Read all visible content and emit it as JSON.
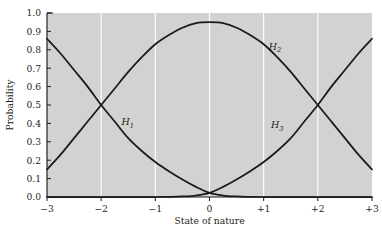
{
  "chart_data": {
    "type": "line",
    "title": "",
    "subtitle": "",
    "xlabel": "State of nature",
    "ylabel": "Probability",
    "xlim": [
      -3,
      3
    ],
    "ylim": [
      0.0,
      1.0
    ],
    "grid": "vertical-white-gridlines-at-major-x-ticks",
    "legend": "inline-curve-labels",
    "xticks": [
      -3,
      -2,
      -1,
      0,
      1,
      2,
      3
    ],
    "xtick_labels": [
      "−3",
      "−2",
      "−1",
      "0",
      "+1",
      "+2",
      "+3"
    ],
    "yticks": [
      0.0,
      0.1,
      0.2,
      0.3,
      0.4,
      0.5,
      0.6,
      0.7,
      0.8,
      0.9,
      1.0
    ],
    "ytick_labels": [
      "0.0",
      "0.1",
      "0.2",
      "0.3",
      "0.4",
      "0.5",
      "0.6",
      "0.7",
      "0.8",
      "0.9",
      "1.0"
    ],
    "x": [
      -3.0,
      -2.75,
      -2.5,
      -2.25,
      -2.0,
      -1.75,
      -1.5,
      -1.25,
      -1.0,
      -0.75,
      -0.5,
      -0.25,
      0.0,
      0.25,
      0.5,
      0.75,
      1.0,
      1.25,
      1.5,
      1.75,
      2.0,
      2.25,
      2.5,
      2.75,
      3.0
    ],
    "series": [
      {
        "name": "H_1",
        "label": "H",
        "subscript": "1",
        "label_x": -1.55,
        "label_y": 0.39,
        "description": "Decreasing sigmoid curve: high probability at left, falls to near zero at right",
        "values": [
          0.86,
          0.78,
          0.69,
          0.6,
          0.5,
          0.41,
          0.32,
          0.25,
          0.19,
          0.14,
          0.095,
          0.055,
          0.022,
          0.008,
          0.003,
          0.001,
          0.0,
          0.0,
          0.0,
          0.0,
          0.0,
          0.0,
          0.0,
          0.0,
          0.0
        ]
      },
      {
        "name": "H_2",
        "label": "H",
        "subscript": "2",
        "label_x": 1.17,
        "label_y": 0.8,
        "description": "Bell-shaped curve peaking at 0.95 at state of nature 0",
        "values": [
          0.15,
          0.23,
          0.32,
          0.41,
          0.5,
          0.59,
          0.68,
          0.76,
          0.83,
          0.88,
          0.92,
          0.945,
          0.95,
          0.945,
          0.92,
          0.88,
          0.83,
          0.76,
          0.68,
          0.59,
          0.5,
          0.41,
          0.32,
          0.23,
          0.15
        ]
      },
      {
        "name": "H_3",
        "label": "H",
        "subscript": "3",
        "label_x": 1.21,
        "label_y": 0.375,
        "description": "Increasing sigmoid curve: near zero at left, rises to high probability at right",
        "values": [
          0.0,
          0.0,
          0.0,
          0.0,
          0.0,
          0.0,
          0.0,
          0.0,
          0.0,
          0.001,
          0.003,
          0.008,
          0.022,
          0.055,
          0.095,
          0.14,
          0.19,
          0.25,
          0.32,
          0.41,
          0.5,
          0.6,
          0.69,
          0.78,
          0.86
        ]
      }
    ],
    "annotations": [
      {
        "text": "H_1 and H_2 cross at x = -2, y = 0.50"
      },
      {
        "text": "H_2 and H_3 cross at x = +2, y = 0.50"
      },
      {
        "text": "H_1 and H_3 cross at x = 0, y ≈ 0.02"
      }
    ],
    "colors": {
      "plot_background": "#d2d2d2",
      "gridline": "#ffffff",
      "curve": "#1a1a1a",
      "axis": "#1a1a1a",
      "text": "#231f20",
      "page_background": "#ffffff"
    }
  }
}
